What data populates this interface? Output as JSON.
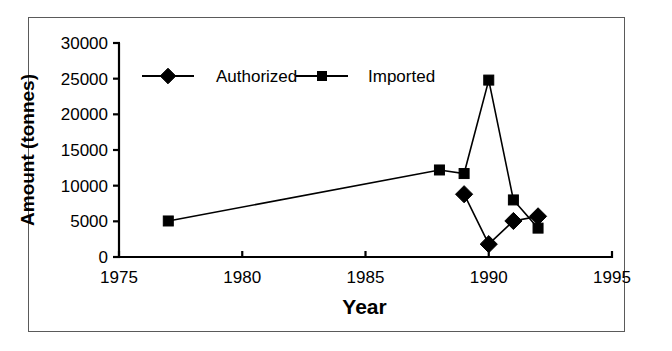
{
  "chart_data": {
    "type": "line",
    "title": "",
    "xlabel": "Year",
    "ylabel": "Amount (tonnes)",
    "xlim": [
      1975,
      1995
    ],
    "ylim": [
      0,
      30000
    ],
    "xticks": [
      "1975",
      "1980",
      "1985",
      "1990",
      "1995"
    ],
    "xtick_values": [
      1975,
      1980,
      1985,
      1990,
      1995
    ],
    "yticks": [
      "0",
      "5000",
      "10000",
      "15000",
      "20000",
      "25000",
      "30000"
    ],
    "ytick_values": [
      0,
      5000,
      10000,
      15000,
      20000,
      25000,
      30000
    ],
    "grid": false,
    "legend_position": "top-center-inside",
    "series": [
      {
        "name": "Authorized",
        "marker": "diamond",
        "x": [
          1989,
          1990,
          1991,
          1992
        ],
        "values": [
          8800,
          1800,
          5050,
          5700
        ]
      },
      {
        "name": "Imported",
        "marker": "square",
        "x": [
          1977,
          1988,
          1989,
          1990,
          1991,
          1992
        ],
        "values": [
          5050,
          12200,
          11700,
          24800,
          8000,
          4050
        ]
      }
    ]
  },
  "colors": {
    "line": "#000000",
    "marker": "#000000",
    "axis": "#000000",
    "frame": "#5a5a5a",
    "background": "#ffffff"
  }
}
